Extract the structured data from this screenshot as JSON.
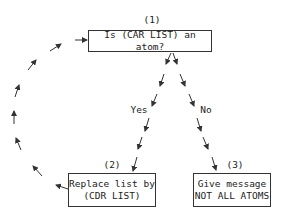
{
  "nodes": [
    {
      "id": "1",
      "number": "(1)",
      "lines": [
        "Is (CAR LIST) an atom?"
      ]
    },
    {
      "id": "2",
      "number": "(2)",
      "lines": [
        "Replace list by",
        "(CDR LIST)"
      ]
    },
    {
      "id": "3",
      "number": "(3)",
      "lines": [
        "Give message",
        "NOT ALL ATOMS"
      ]
    }
  ],
  "edges": [
    {
      "from": "1",
      "to": "2",
      "label": "Yes",
      "style": "dashed-arrow"
    },
    {
      "from": "1",
      "to": "3",
      "label": "No",
      "style": "dashed-arrow"
    },
    {
      "from": "2",
      "to": "1",
      "label": "",
      "style": "dashed-arrow-loop"
    }
  ]
}
